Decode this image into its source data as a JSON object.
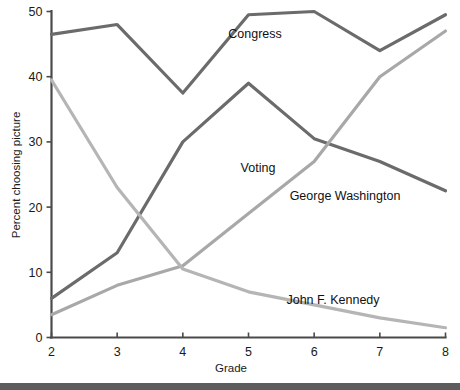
{
  "chart_data": {
    "type": "line",
    "title": "",
    "xlabel": "Grade",
    "ylabel": "Percent choosing picture",
    "x": [
      2,
      3,
      4,
      5,
      6,
      7,
      8
    ],
    "categories": [
      "2",
      "3",
      "4",
      "5",
      "6",
      "7",
      "8"
    ],
    "xlim": [
      2,
      8
    ],
    "ylim": [
      0,
      50
    ],
    "ytick_labels": [
      "0",
      "10",
      "20",
      "30",
      "40",
      "50"
    ],
    "yticks": [
      0,
      10,
      20,
      30,
      40,
      50
    ],
    "grid": false,
    "legend": "inline-labels",
    "series": [
      {
        "name": "Congress",
        "color": "#6b6b6b",
        "values": [
          46.5,
          48,
          37.5,
          49.5,
          50,
          44,
          49.5
        ],
        "label": "Congress",
        "label_x": 255,
        "label_y": 38
      },
      {
        "name": "Voting",
        "color": "#6b6b6b",
        "values": [
          6,
          13,
          30,
          39,
          30.5,
          27,
          22.5
        ],
        "label": "Voting",
        "label_x": 258,
        "label_y": 172
      },
      {
        "name": "George Washington",
        "color": "#a8a8a8",
        "values": [
          3.5,
          8,
          11,
          19,
          27,
          40,
          47
        ],
        "label": "George Washington",
        "label_x": 345,
        "label_y": 200
      },
      {
        "name": "John F. Kennedy",
        "color": "#b5b5b5",
        "values": [
          39.5,
          23,
          10.5,
          7,
          5,
          3,
          1.5
        ],
        "label": "John F. Kennedy",
        "label_x": 333,
        "label_y": 304
      }
    ]
  },
  "axis": {
    "x_label": "Grade",
    "y_label": "Percent choosing picture"
  },
  "colors": {
    "dark_line": "#6b6b6b",
    "light_line": "#b5b5b5",
    "axis": "#4a4a4a",
    "text": "#111111",
    "bottom_rule": "#5d5d5d"
  }
}
